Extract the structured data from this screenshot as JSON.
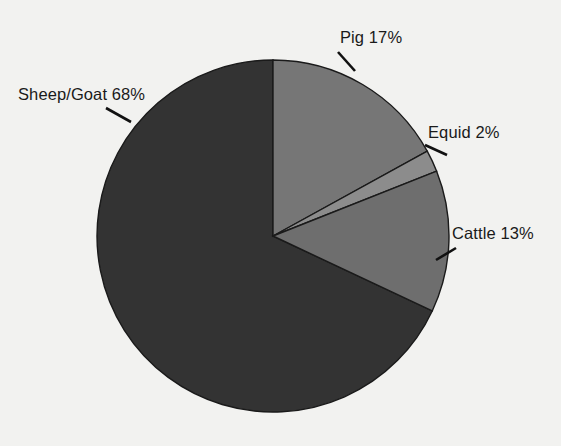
{
  "background_color": "#f2f2f0",
  "chart_data": {
    "type": "pie",
    "title": "",
    "categories": [
      "Pig",
      "Equid",
      "Cattle",
      "Sheep/Goat"
    ],
    "values": [
      17,
      2,
      13,
      68
    ],
    "unit": "%",
    "labels": [
      {
        "name": "pig",
        "text": "Pig 17%",
        "category": "Pig",
        "value": 17,
        "color": "#767676"
      },
      {
        "name": "equid",
        "text": "Equid 2%",
        "category": "Equid",
        "value": 2,
        "color": "#8c8c8c"
      },
      {
        "name": "cattle",
        "text": "Cattle 13%",
        "category": "Cattle",
        "value": 13,
        "color": "#6e6e6e"
      },
      {
        "name": "sheep-goat",
        "text": "Sheep/Goat 68%",
        "category": "Sheep/Goat",
        "value": 68,
        "color": "#333333"
      }
    ],
    "legend": "none",
    "start_angle_deg": 0,
    "direction": "clockwise",
    "geometry": {
      "cx": 273,
      "cy": 236,
      "r": 176
    },
    "slice_border_color": "#1a1a1a",
    "leader_line_color": "#111111"
  }
}
